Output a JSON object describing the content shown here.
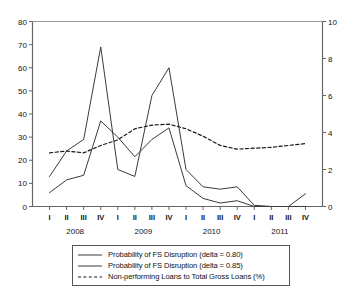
{
  "chart_data": {
    "type": "line",
    "title": "",
    "xlabel": "",
    "ylabel": "",
    "y2label": "",
    "grid": false,
    "legend_position": "bottom",
    "ylim": [
      0,
      80
    ],
    "y2lim": [
      0,
      10
    ],
    "yticks": [
      0,
      10,
      20,
      30,
      40,
      50,
      60,
      70,
      80
    ],
    "y2ticks": [
      0,
      2,
      4,
      6,
      8,
      10
    ],
    "categories": [
      "I",
      "II",
      "III",
      "IV",
      "I",
      "II",
      "III",
      "IV",
      "I",
      "II",
      "III",
      "IV",
      "I",
      "II",
      "III",
      "IV"
    ],
    "year_groups": [
      {
        "label": "2008",
        "start_index": 0,
        "end_index": 3
      },
      {
        "label": "2009",
        "start_index": 4,
        "end_index": 7
      },
      {
        "label": "2010",
        "start_index": 8,
        "end_index": 11
      },
      {
        "label": "2011",
        "start_index": 12,
        "end_index": 15
      }
    ],
    "series": [
      {
        "name": "Probability of FS Disruption (delta = 0.80)",
        "axis": "left",
        "style": "solid",
        "color": "#3a3a3a",
        "values": [
          13,
          24,
          29,
          69,
          16,
          13,
          48,
          60,
          16,
          8.5,
          7.5,
          8.5,
          0.5,
          0,
          0,
          5.5
        ]
      },
      {
        "name": "Probability of FS Disruption (delta = 0.85)",
        "axis": "left",
        "style": "solid",
        "color": "#3a3a3a",
        "values": [
          6,
          11.5,
          13.5,
          37,
          30,
          21.5,
          29,
          34,
          9,
          3.5,
          1.5,
          2.5,
          0,
          0,
          0,
          0
        ]
      },
      {
        "name": "Non-performing Loans to Total Gross Loans (%)",
        "axis": "right",
        "style": "dashed",
        "color": "#1a1a1a",
        "values": [
          2.9,
          3.0,
          2.9,
          3.3,
          3.6,
          4.2,
          4.4,
          4.45,
          4.2,
          3.8,
          3.3,
          3.1,
          3.15,
          3.2,
          3.3,
          3.4
        ]
      }
    ]
  },
  "axes": {
    "left_tick_labels": [
      "80",
      "70",
      "60",
      "50",
      "40",
      "30",
      "20",
      "10",
      "0"
    ],
    "right_tick_labels": [
      "10",
      "8",
      "6",
      "4",
      "2",
      "0"
    ]
  },
  "legend": {
    "items": [
      {
        "label": "Probability of FS Disruption (delta = 0.80)",
        "style": "solid"
      },
      {
        "label": "Probability of FS Disruption (delta = 0.85)",
        "style": "solid"
      },
      {
        "label": "Non-performing Loans to Total Gross Loans (%)",
        "style": "dashed"
      }
    ]
  }
}
